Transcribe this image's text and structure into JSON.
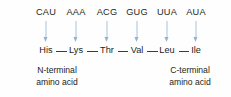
{
  "diagram": {
    "colors": {
      "arrow": "#a8c4dc",
      "arrow_head": "#8fb3d0",
      "text": "#231f20",
      "bond": "#3c3c3c",
      "background": "#fefefe"
    },
    "codons": [
      {
        "label": "CAU",
        "x": 46
      },
      {
        "label": "AAA",
        "x": 76
      },
      {
        "label": "ACG",
        "x": 107
      },
      {
        "label": "GUG",
        "x": 137
      },
      {
        "label": "UUA",
        "x": 167
      },
      {
        "label": "AUA",
        "x": 196
      }
    ],
    "amino_acids": [
      {
        "label": "His",
        "x": 46
      },
      {
        "label": "Lys",
        "x": 76
      },
      {
        "label": "Thr",
        "x": 107
      },
      {
        "label": "Val",
        "x": 137
      },
      {
        "label": "Leu",
        "x": 167
      },
      {
        "label": "Ile",
        "x": 196
      }
    ],
    "bond_symbol": "—",
    "terminals": {
      "n": {
        "line1": "N-terminal",
        "line2": "amino acid",
        "x": 57
      },
      "c": {
        "line1": "C-terminal",
        "line2": "amino acid",
        "x": 190
      }
    }
  }
}
